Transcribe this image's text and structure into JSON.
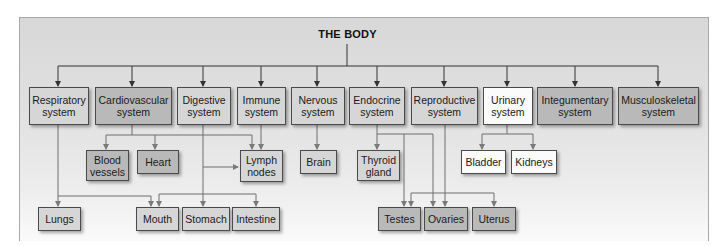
{
  "title": "THE BODY",
  "colors": {
    "light_box": "#d6d6d6",
    "dark_box": "#b9b9b9",
    "white_box": "#fbfbfb",
    "line": "#555555",
    "line_light": "#8a8a8a"
  },
  "systems": [
    {
      "id": "respiratory",
      "label": "Respiratory system",
      "line1": "Respiratory",
      "line2": "system",
      "shade": "light"
    },
    {
      "id": "cardiovascular",
      "label": "Cardiovascular system",
      "line1": "Cardiovascular",
      "line2": "system",
      "shade": "dark"
    },
    {
      "id": "digestive",
      "label": "Digestive system",
      "line1": "Digestive",
      "line2": "system",
      "shade": "light"
    },
    {
      "id": "immune",
      "label": "Immune system",
      "line1": "Immune",
      "line2": "system",
      "shade": "light"
    },
    {
      "id": "nervous",
      "label": "Nervous system",
      "line1": "Nervous",
      "line2": "system",
      "shade": "light"
    },
    {
      "id": "endocrine",
      "label": "Endocrine system",
      "line1": "Endocrine",
      "line2": "system",
      "shade": "light"
    },
    {
      "id": "reproductive",
      "label": "Reproductive system",
      "line1": "Reproductive",
      "line2": "system",
      "shade": "light"
    },
    {
      "id": "urinary",
      "label": "Urinary system",
      "line1": "Urinary",
      "line2": "system",
      "shade": "white"
    },
    {
      "id": "integumentary",
      "label": "Integumentary system",
      "line1": "Integumentary",
      "line2": "system",
      "shade": "dark"
    },
    {
      "id": "musculoskeletal",
      "label": "Musculoskeletal system",
      "line1": "Musculoskeletal",
      "line2": "system",
      "shade": "dark"
    }
  ],
  "organs": {
    "blood_vessels": {
      "line1": "Blood",
      "line2": "vessels",
      "parents": [
        "cardiovascular"
      ]
    },
    "heart": {
      "label": "Heart",
      "parents": [
        "cardiovascular"
      ]
    },
    "lymph_nodes": {
      "line1": "Lymph",
      "line2": "nodes",
      "parents": [
        "cardiovascular",
        "immune",
        "digestive"
      ]
    },
    "brain": {
      "label": "Brain",
      "parents": [
        "nervous"
      ]
    },
    "thyroid_gland": {
      "line1": "Thyroid",
      "line2": "gland",
      "parents": [
        "endocrine"
      ]
    },
    "bladder": {
      "label": "Bladder",
      "parents": [
        "urinary"
      ]
    },
    "kidneys": {
      "label": "Kidneys",
      "parents": [
        "urinary"
      ]
    },
    "lungs": {
      "label": "Lungs",
      "parents": [
        "respiratory"
      ]
    },
    "mouth": {
      "label": "Mouth",
      "parents": [
        "respiratory",
        "digestive"
      ]
    },
    "stomach": {
      "label": "Stomach",
      "parents": [
        "digestive"
      ]
    },
    "intestine": {
      "label": "Intestine",
      "parents": [
        "digestive"
      ]
    },
    "testes": {
      "label": "Testes",
      "parents": [
        "endocrine",
        "reproductive"
      ]
    },
    "ovaries": {
      "label": "Ovaries",
      "parents": [
        "endocrine",
        "reproductive"
      ]
    },
    "uterus": {
      "label": "Uterus",
      "parents": [
        "reproductive"
      ]
    }
  }
}
